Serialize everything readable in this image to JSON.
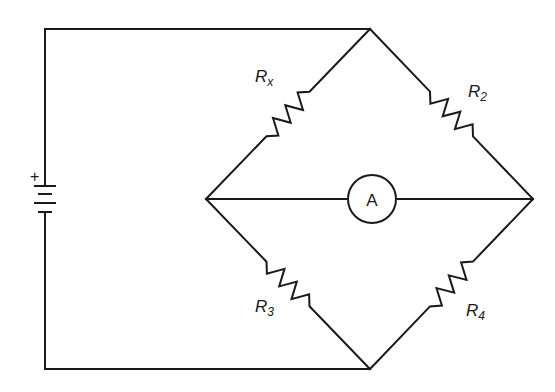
{
  "diagram": {
    "colors": {
      "line": "#1a1a1a",
      "background": "#ffffff"
    },
    "nodes": {
      "top": [
        370,
        29
      ],
      "bottom": [
        370,
        369
      ],
      "left": [
        206,
        199
      ],
      "right": [
        533,
        199
      ]
    },
    "battery": {
      "x": 45,
      "positive_sign": "+",
      "plates": [
        {
          "y": 186,
          "type": "long"
        },
        {
          "y": 194,
          "type": "short"
        },
        {
          "y": 203,
          "type": "long"
        },
        {
          "y": 212,
          "type": "short"
        }
      ]
    },
    "resistors": [
      {
        "id": "Rx",
        "base": "R",
        "sub": "x",
        "from": "left",
        "to": "top",
        "label_pos": [
          255,
          82
        ]
      },
      {
        "id": "R2",
        "base": "R",
        "sub": "2",
        "from": "top",
        "to": "right",
        "label_pos": [
          468,
          97
        ]
      },
      {
        "id": "R3",
        "base": "R",
        "sub": "3",
        "from": "left",
        "to": "bottom",
        "label_pos": [
          255,
          312
        ]
      },
      {
        "id": "R4",
        "base": "R",
        "sub": "4",
        "from": "bottom",
        "to": "right",
        "label_pos": [
          466,
          316
        ]
      }
    ],
    "ammeter": {
      "label": "A",
      "center": [
        372,
        199
      ],
      "radius": 24
    }
  }
}
